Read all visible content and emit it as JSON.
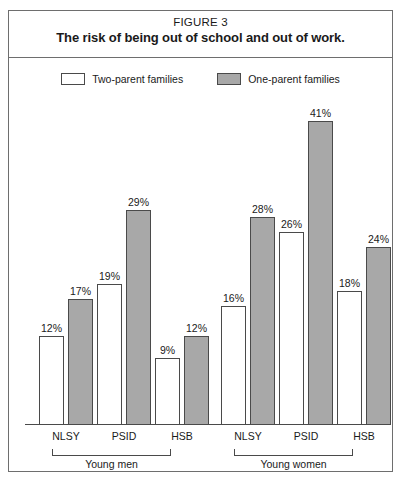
{
  "figure": {
    "number": "FIGURE 3",
    "title": "The risk of being out of school and out of work."
  },
  "legend": {
    "entries": [
      {
        "label": "Two-parent families",
        "swatch": "white-square-icon",
        "color": "#ffffff"
      },
      {
        "label": "One-parent families",
        "swatch": "gray-square-icon",
        "color": "#a8a8a8"
      }
    ]
  },
  "groups": [
    {
      "label": "Young men"
    },
    {
      "label": "Young women"
    }
  ],
  "categories": [
    "NLSY",
    "PSID",
    "HSB",
    "NLSY",
    "PSID",
    "HSB"
  ],
  "footnote": "",
  "chart_data": {
    "type": "bar",
    "title": "The risk of being out of school and out of work.",
    "subtitle": "FIGURE 3",
    "xlabel": "",
    "ylabel": "",
    "ylim": [
      0,
      43
    ],
    "grid": false,
    "legend_position": "top-center",
    "value_suffix": "%",
    "categories": [
      "NLSY",
      "PSID",
      "HSB",
      "NLSY",
      "PSID",
      "HSB"
    ],
    "group_labels": [
      "Young men",
      "Young men",
      "Young men",
      "Young women",
      "Young women",
      "Young women"
    ],
    "series": [
      {
        "name": "Two-parent families",
        "color": "#ffffff",
        "values": [
          12,
          19,
          9,
          16,
          26,
          18
        ],
        "labels": [
          "12%",
          "19%",
          "9%",
          "16%",
          "26%",
          "18%"
        ]
      },
      {
        "name": "One-parent families",
        "color": "#a8a8a8",
        "values": [
          17,
          29,
          12,
          28,
          41,
          24
        ],
        "labels": [
          "17%",
          "29%",
          "12%",
          "28%",
          "41%",
          "24%"
        ]
      }
    ]
  }
}
